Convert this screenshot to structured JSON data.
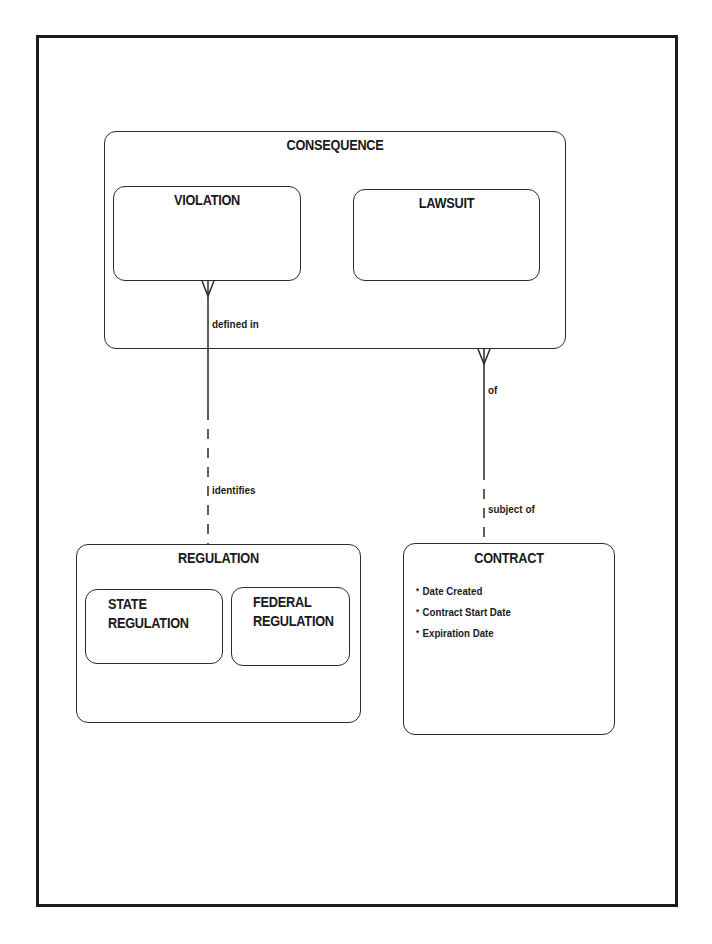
{
  "diagram": {
    "type": "entity-relationship",
    "notation": "Barker (crow's foot)",
    "entities": {
      "consequence": {
        "name": "CONSEQUENCE",
        "subtypes": [
          {
            "name": "VIOLATION"
          },
          {
            "name": "LAWSUIT"
          }
        ]
      },
      "regulation": {
        "name": "REGULATION",
        "subtypes": [
          {
            "name": "STATE\nREGULATION"
          },
          {
            "name": "FEDERAL\nREGULATION"
          }
        ]
      },
      "contract": {
        "name": "CONTRACT",
        "attributes": [
          {
            "marker": "*",
            "name": "Date Created"
          },
          {
            "marker": "*",
            "name": "Contract Start Date"
          },
          {
            "marker": "*",
            "name": "Expiration Date"
          }
        ]
      }
    },
    "relationships": [
      {
        "from": "VIOLATION",
        "to": "REGULATION",
        "from_label": "defined in",
        "to_label": "identifies",
        "from_cardinality": "many",
        "from_optionality": "mandatory",
        "to_optionality": "optional"
      },
      {
        "from": "CONSEQUENCE",
        "to": "CONTRACT",
        "from_label": "of",
        "to_label": "subject of",
        "from_cardinality": "many",
        "from_optionality": "mandatory",
        "to_optionality": "optional"
      }
    ]
  },
  "colors": {
    "line": "#2a2a2a",
    "frame": "#1c1c1c",
    "background": "#ffffff"
  }
}
